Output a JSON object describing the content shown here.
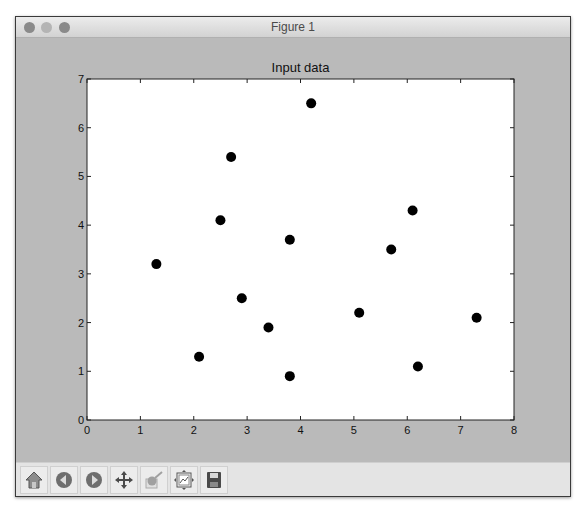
{
  "window": {
    "title": "Figure 1",
    "traffic_lights": [
      {
        "name": "close",
        "color": "#8a8a8a"
      },
      {
        "name": "minimize",
        "color": "#b4b4b4"
      },
      {
        "name": "zoom",
        "color": "#8a8a8a"
      }
    ]
  },
  "toolbar": {
    "buttons": [
      {
        "name": "home",
        "icon": "home-icon",
        "tooltip": "Reset original view"
      },
      {
        "name": "back",
        "icon": "back-arrow-icon",
        "tooltip": "Back to previous view"
      },
      {
        "name": "forward",
        "icon": "forward-arrow-icon",
        "tooltip": "Forward to next view"
      },
      {
        "name": "pan",
        "icon": "move-icon",
        "tooltip": "Pan axes"
      },
      {
        "name": "zoom",
        "icon": "zoom-rect-icon",
        "tooltip": "Zoom to rectangle"
      },
      {
        "name": "subplots",
        "icon": "subplots-icon",
        "tooltip": "Configure subplots"
      },
      {
        "name": "save",
        "icon": "floppy-disk-icon",
        "tooltip": "Save the figure"
      }
    ]
  },
  "chart_data": {
    "type": "scatter",
    "title": "Input data",
    "xlabel": "",
    "ylabel": "",
    "xlim": [
      0,
      8
    ],
    "ylim": [
      0,
      7
    ],
    "xticks": [
      "0",
      "1",
      "2",
      "3",
      "4",
      "5",
      "6",
      "7",
      "8"
    ],
    "yticks": [
      "0",
      "1",
      "2",
      "3",
      "4",
      "5",
      "6",
      "7"
    ],
    "grid": false,
    "legend": null,
    "marker_color": "#000000",
    "series": [
      {
        "name": "data",
        "points": [
          {
            "x": 1.3,
            "y": 3.2
          },
          {
            "x": 2.1,
            "y": 1.3
          },
          {
            "x": 2.5,
            "y": 4.1
          },
          {
            "x": 2.7,
            "y": 5.4
          },
          {
            "x": 2.9,
            "y": 2.5
          },
          {
            "x": 3.4,
            "y": 1.9
          },
          {
            "x": 3.8,
            "y": 3.7
          },
          {
            "x": 3.8,
            "y": 0.9
          },
          {
            "x": 4.2,
            "y": 6.5
          },
          {
            "x": 5.1,
            "y": 2.2
          },
          {
            "x": 5.7,
            "y": 3.5
          },
          {
            "x": 6.1,
            "y": 4.3
          },
          {
            "x": 6.2,
            "y": 1.1
          },
          {
            "x": 7.3,
            "y": 2.1
          }
        ]
      }
    ]
  }
}
